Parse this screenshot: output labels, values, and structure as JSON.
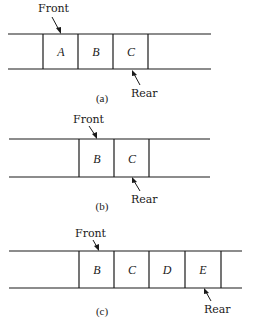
{
  "diagrams": [
    {
      "caption": "(a)",
      "front_label": "Front",
      "rear_label": "Rear",
      "cells": [
        "A",
        "B",
        "C"
      ]
    },
    {
      "caption": "(b)",
      "front_label": "Front",
      "rear_label": "Rear",
      "cells": [
        "B",
        "C"
      ]
    },
    {
      "caption": "(c)",
      "front_label": "Front",
      "rear_label": "Rear",
      "cells": [
        "B",
        "C",
        "D",
        "E"
      ]
    }
  ]
}
